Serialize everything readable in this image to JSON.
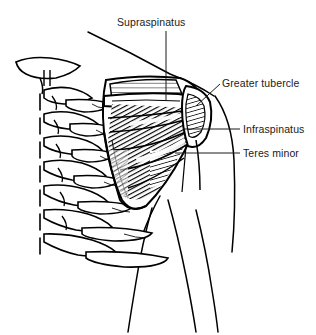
{
  "figure": {
    "name": "posterior-shoulder-rotator-cuff",
    "background_color": "#ffffff",
    "ink_color": "#000000",
    "label_color": "#1a1a1a",
    "labels": [
      {
        "id": "supraspinatus",
        "text": "Supraspinatus",
        "x": 117,
        "y": 26,
        "anchor": "start"
      },
      {
        "id": "greater-tubercle",
        "text": "Greater tubercle",
        "x": 222,
        "y": 87,
        "anchor": "start"
      },
      {
        "id": "infraspinatus",
        "text": "Infraspinatus",
        "x": 243,
        "y": 133,
        "anchor": "start"
      },
      {
        "id": "teres-minor",
        "text": "Teres minor",
        "x": 243,
        "y": 157,
        "anchor": "start"
      }
    ],
    "leaders": [
      {
        "id": "leader-supraspinatus",
        "d": "M166,31 L166,101"
      },
      {
        "id": "leader-greater-tubercle",
        "d": "M220,84 L196,106"
      },
      {
        "id": "leader-infraspinatus",
        "d": "M240,129 L183,129"
      },
      {
        "id": "leader-teres-minor",
        "d": "M240,153 L175,153"
      }
    ],
    "structures": {
      "vertebrae": "cervicothoracic-spinous-processes",
      "ribs": "posterior-rib-cage",
      "scapula": "left-scapula-posterior-view",
      "humerus": "proximal-humerus-greater-tubercle",
      "supraspinatus_fossa": "light-hatched",
      "infraspinatus_belly": "dense-hatched",
      "teres_minor_belly": "dense-hatched",
      "torso_outline": "trapezius-deltoid-arm-contour"
    }
  }
}
